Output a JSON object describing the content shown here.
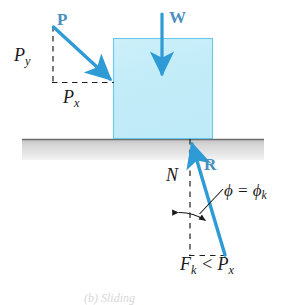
{
  "figure": {
    "background_color": "#ffffff",
    "arrow_color": "#2e9bd6",
    "label_vector_color": "#4a8fc0",
    "block_fill_color": "#c5ecf7",
    "block_border_color": "#6ecbe8",
    "ground_fill_top_color": "#c9c9c9",
    "ground_fill_bottom_color": "#ececec",
    "ground_line_color": "#6e6e6e",
    "dashed_line_color": "#222222",
    "text_color": "#1a1a1a"
  },
  "labels": {
    "applied_force": "P",
    "weight": "W",
    "resultant": "R",
    "force_y_component_base": "P",
    "force_y_component_sub": "y",
    "force_x_component_base": "P",
    "force_x_component_sub": "x",
    "normal_force": "N",
    "friction_angle_base": "ϕ = ϕ",
    "friction_angle_sub": "k",
    "friction_inequality_prefix": "F",
    "friction_inequality_prefix_sub": "k",
    "friction_inequality_middle": " < P",
    "friction_inequality_suffix_sub": "x",
    "caption_cropped": "(b) Sliding"
  },
  "geometry": {
    "block": {
      "x": 113,
      "y": 38,
      "width": 100,
      "height": 100
    },
    "ground": {
      "x": 22,
      "y": 138,
      "width": 242,
      "height": 22
    },
    "vector_P": {
      "x1": 53,
      "y1": 27,
      "x2": 113,
      "y2": 82
    },
    "vector_W": {
      "x1": 162,
      "y1": 14,
      "x2": 162,
      "y2": 80
    },
    "vector_R": {
      "x1": 225,
      "y1": 255,
      "x2": 190,
      "y2": 137
    },
    "dashed_Py": {
      "x1": 53,
      "y1": 27,
      "x2": 53,
      "y2": 82
    },
    "dashed_Px": {
      "x1": 53,
      "y1": 82,
      "x2": 113,
      "y2": 82
    },
    "dashed_N": {
      "x1": 190,
      "y1": 138,
      "x2": 190,
      "y2": 255
    },
    "dashed_Fk": {
      "x1": 190,
      "y1": 255,
      "x2": 225,
      "y2": 255
    },
    "angle_arc_center": {
      "x": 190,
      "y": 255
    },
    "angle_arc_radius": 47,
    "leader_line": {
      "x1": 222,
      "y1": 190,
      "x2": 200,
      "y2": 213
    }
  }
}
